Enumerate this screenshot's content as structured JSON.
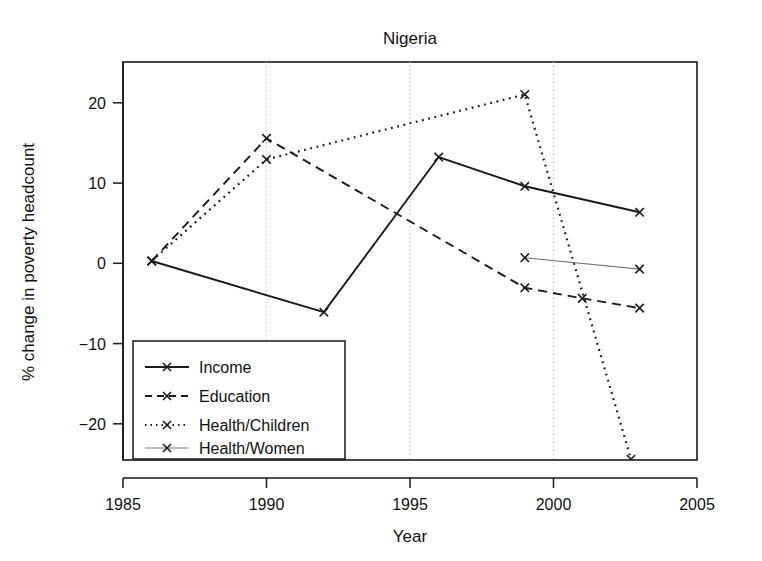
{
  "chart_data": {
    "type": "line",
    "title": "Nigeria",
    "xlabel": "Year",
    "ylabel": "% change in poverty headcount",
    "xlim": [
      1985,
      2005
    ],
    "ylim": [
      -24.5,
      24.5
    ],
    "xticks": [
      1985,
      1990,
      1995,
      2000,
      2005
    ],
    "xtick_labels": [
      "1985",
      "1990",
      "1995",
      "2000",
      "2005"
    ],
    "yticks": [
      20,
      10,
      0,
      -10,
      -20
    ],
    "ytick_labels": [
      "20",
      "10",
      "0",
      "−10",
      "−20"
    ],
    "grid": "vertical dotted gridlines at 1990, 1995, 2000",
    "legend_position": "lower left inside axes",
    "series": [
      {
        "name": "Income",
        "style": "solid",
        "color": "#1a1a1a",
        "marker": "x",
        "x": [
          1986,
          1992,
          1996,
          1999,
          2003
        ],
        "y": [
          0.0,
          -6.3,
          12.8,
          9.2,
          6.0
        ]
      },
      {
        "name": "Education",
        "style": "dashed",
        "color": "#1a1a1a",
        "marker": "x",
        "x": [
          1986,
          1990,
          1999,
          2001,
          2003
        ],
        "y": [
          0.0,
          15.1,
          -3.3,
          -4.6,
          -5.8
        ]
      },
      {
        "name": "Health/Children",
        "style": "dotted",
        "color": "#1a1a1a",
        "marker": "x",
        "x": [
          1986,
          1990,
          1999,
          2002.7
        ],
        "y": [
          0.0,
          12.5,
          20.5,
          -24.4
        ]
      },
      {
        "name": "Health/Women",
        "style": "solid-thin",
        "color": "#777777",
        "marker": "x",
        "x": [
          1999,
          2003
        ],
        "y": [
          0.4,
          -1.0
        ]
      }
    ]
  },
  "legend": {
    "entries": [
      {
        "label": "Income"
      },
      {
        "label": "Education"
      },
      {
        "label": "Health/Children"
      },
      {
        "label": "Health/Women"
      }
    ]
  }
}
